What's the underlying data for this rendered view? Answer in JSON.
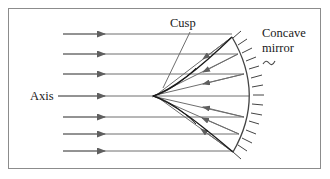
{
  "figure": {
    "background_color": "#ffffff",
    "frame_color": "#8c8c8c",
    "ray_color": "#6e6e6e",
    "caustic_color": "#1a1a1a",
    "mirror_color": "#444444",
    "text_color": "#1a1a1a"
  },
  "labels": {
    "axis": "Axis",
    "cusp": "Cusp",
    "mirror_line1": "Concave",
    "mirror_line2": "mirror",
    "mirror_squiggle": "~"
  },
  "diagram_data": {
    "type": "ray-diagram",
    "description": "Seven parallel horizontal rays travel left to right, strike a concave mirror arc on the right, and reflect to form a caustic with a cusp on the axis.",
    "incident_rays": [
      {
        "y": 34,
        "x_start": 63,
        "x_end": 232,
        "arrow_x": 104
      },
      {
        "y": 54,
        "x_start": 63,
        "x_end": 238,
        "arrow_x": 104
      },
      {
        "y": 74,
        "x_start": 63,
        "x_end": 244,
        "arrow_x": 104
      },
      {
        "y": 96,
        "x_start": 63,
        "x_end": 248,
        "arrow_x": 104
      },
      {
        "y": 117,
        "x_start": 63,
        "x_end": 244,
        "arrow_x": 104
      },
      {
        "y": 134,
        "x_start": 63,
        "x_end": 239,
        "arrow_x": 104
      },
      {
        "y": 151,
        "x_start": 63,
        "x_end": 233,
        "arrow_x": 104
      }
    ],
    "reflected_rays": [
      {
        "x1": 232,
        "y1": 37,
        "x2": 155,
        "y2": 96,
        "arrow_t": 0.42
      },
      {
        "x1": 238,
        "y1": 54,
        "x2": 152,
        "y2": 97,
        "arrow_t": 0.45
      },
      {
        "x1": 244,
        "y1": 74,
        "x2": 152,
        "y2": 96,
        "arrow_t": 0.48
      },
      {
        "x1": 244,
        "y1": 117,
        "x2": 152,
        "y2": 96,
        "arrow_t": 0.48
      },
      {
        "x1": 239,
        "y1": 134,
        "x2": 153,
        "y2": 96,
        "arrow_t": 0.45
      },
      {
        "x1": 233,
        "y1": 152,
        "x2": 156,
        "y2": 96,
        "arrow_t": 0.42
      }
    ],
    "caustic_cusp_point": {
      "x": 153,
      "y": 96
    },
    "mirror_arc": {
      "top": {
        "x": 232,
        "y": 37
      },
      "vertex": {
        "x": 249,
        "y": 95
      },
      "bottom": {
        "x": 233,
        "y": 152
      },
      "hatch_count": 18
    },
    "axis": {
      "y": 96,
      "label_x": 30,
      "label_y": 100
    },
    "cusp_leader": {
      "x1": 190,
      "y1": 32,
      "x2": 163,
      "y2": 88
    },
    "mirror_leader": {
      "x1": 262,
      "y1": 62,
      "x2": 272,
      "y2": 60
    }
  }
}
